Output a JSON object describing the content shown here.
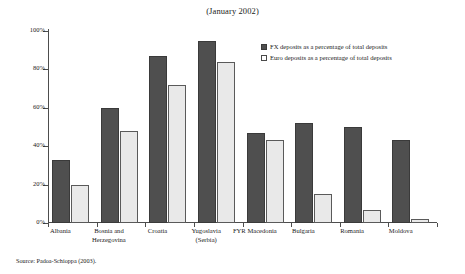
{
  "chart_data": {
    "type": "bar",
    "title": "(January 2002)",
    "xlabel": "",
    "ylabel": "",
    "ylim": [
      0,
      100
    ],
    "ytick_labels": [
      "0%",
      "20%",
      "40%",
      "60%",
      "80%",
      "100%"
    ],
    "ytick_values": [
      0,
      20,
      40,
      60,
      80,
      100
    ],
    "grid": false,
    "legend_position": "top-right",
    "categories": [
      "Albania",
      "Bosnia and Herzegovina",
      "Croatia",
      "Yugoslavia (Serbia)",
      "FYR Macedonia",
      "Bulgaria",
      "Romania",
      "Moldova"
    ],
    "category_lines": [
      [
        "Albania"
      ],
      [
        "Bosnia and",
        "Herzegovina"
      ],
      [
        "Croatia"
      ],
      [
        "Yugoslavia",
        "(Serbia)"
      ],
      [
        "FYR Macedonia"
      ],
      [
        "Bulgaria"
      ],
      [
        "Romania"
      ],
      [
        "Moldova"
      ]
    ],
    "series": [
      {
        "name": "FX deposits as a percentage of total deposits",
        "color": "#4f4f4f",
        "values": [
          33,
          60,
          87,
          95,
          47,
          52,
          50,
          43
        ]
      },
      {
        "name": "Euro deposits as a percentage of total deposits",
        "color": "#e9e9e9",
        "values": [
          20,
          48,
          72,
          84,
          43,
          15,
          7,
          2
        ]
      }
    ]
  },
  "source": {
    "text": "Source: Padoa-Schioppa (2003)."
  }
}
